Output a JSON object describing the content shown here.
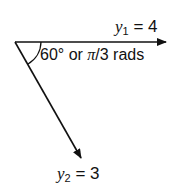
{
  "diagram": {
    "type": "vector-diagram",
    "vectors": [
      {
        "name": "y1",
        "symbol": "y",
        "subscript": "1",
        "equals": " = ",
        "value": "4",
        "direction": "horizontal-right"
      },
      {
        "name": "y2",
        "symbol": "y",
        "subscript": "2",
        "equals": " = ",
        "value": "3",
        "direction": "down-right-60deg"
      }
    ],
    "angle": {
      "degrees_text": "60° or ",
      "pi_symbol": "π",
      "radians_text": "/3 rads"
    },
    "colors": {
      "stroke": "#111111",
      "background": "#ffffff"
    }
  }
}
